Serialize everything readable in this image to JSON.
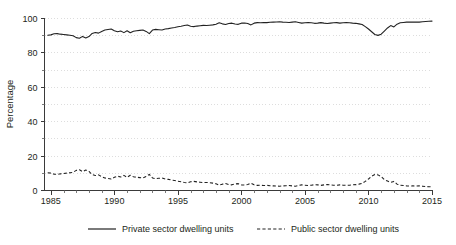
{
  "chart_data": {
    "type": "line",
    "title": "",
    "xlabel": "",
    "ylabel": "Percentage",
    "xlim": [
      1984.5,
      2015.0
    ],
    "ylim": [
      0,
      100
    ],
    "grid": true,
    "grid_interval": 10,
    "legend_position": "bottom",
    "x_ticks_major": [
      1985,
      1990,
      1995,
      2000,
      2005,
      2010,
      2015
    ],
    "x_tick_labels": [
      "1985",
      "1990",
      "1995",
      "2000",
      "2005",
      "2010",
      "2015"
    ],
    "x_minor_interval": 1,
    "y_ticks_major": [
      0,
      20,
      40,
      60,
      80,
      100
    ],
    "y_tick_labels": [
      "0",
      "20",
      "40",
      "60",
      "80",
      "100"
    ],
    "series": [
      {
        "name": "Private sector dwelling units",
        "style": "solid",
        "color": "#222222",
        "x": [
          1984.75,
          1985.0,
          1985.25,
          1985.5,
          1985.75,
          1986.0,
          1986.25,
          1986.5,
          1986.75,
          1987.0,
          1987.25,
          1987.5,
          1987.75,
          1988.0,
          1988.25,
          1988.5,
          1988.75,
          1989.0,
          1989.25,
          1989.5,
          1989.75,
          1990.0,
          1990.25,
          1990.5,
          1990.75,
          1991.0,
          1991.25,
          1991.5,
          1991.75,
          1992.0,
          1992.25,
          1992.5,
          1992.75,
          1993.0,
          1993.25,
          1993.5,
          1993.75,
          1994.0,
          1994.25,
          1994.5,
          1994.75,
          1995.0,
          1995.25,
          1995.5,
          1995.75,
          1996.0,
          1996.25,
          1996.5,
          1996.75,
          1997.0,
          1997.25,
          1997.5,
          1997.75,
          1998.0,
          1998.25,
          1998.5,
          1998.75,
          1999.0,
          1999.25,
          1999.5,
          1999.75,
          2000.0,
          2000.25,
          2000.5,
          2000.75,
          2001.0,
          2001.25,
          2001.5,
          2001.75,
          2002.0,
          2002.25,
          2002.5,
          2002.75,
          2003.0,
          2003.25,
          2003.5,
          2003.75,
          2004.0,
          2004.25,
          2004.5,
          2004.75,
          2005.0,
          2005.25,
          2005.5,
          2005.75,
          2006.0,
          2006.25,
          2006.5,
          2006.75,
          2007.0,
          2007.25,
          2007.5,
          2007.75,
          2008.0,
          2008.25,
          2008.5,
          2008.75,
          2009.0,
          2009.25,
          2009.5,
          2009.75,
          2010.0,
          2010.25,
          2010.5,
          2010.75,
          2011.0,
          2011.25,
          2011.5,
          2011.75,
          2012.0,
          2012.25,
          2012.5,
          2012.75,
          2013.0,
          2013.25,
          2013.5,
          2013.75,
          2014.0,
          2014.25,
          2014.5,
          2014.75,
          2015.0
        ],
        "values": [
          90.0,
          90.2,
          90.8,
          90.9,
          90.6,
          90.4,
          90.2,
          90.0,
          89.7,
          88.6,
          88.2,
          89.3,
          88.4,
          89.2,
          91.0,
          91.6,
          91.2,
          92.2,
          93.0,
          93.3,
          93.6,
          92.6,
          92.0,
          92.4,
          91.5,
          92.6,
          91.4,
          92.3,
          92.6,
          92.8,
          93.0,
          92.2,
          90.9,
          93.0,
          93.4,
          93.2,
          93.0,
          93.6,
          93.8,
          94.2,
          94.5,
          94.9,
          95.2,
          95.6,
          95.9,
          95.2,
          95.0,
          95.3,
          95.5,
          95.7,
          95.6,
          95.8,
          96.0,
          96.4,
          97.2,
          96.6,
          96.2,
          96.8,
          97.0,
          96.5,
          96.3,
          97.0,
          97.1,
          96.8,
          96.0,
          97.0,
          97.3,
          97.2,
          97.4,
          97.3,
          97.5,
          97.6,
          97.7,
          97.8,
          97.6,
          97.5,
          97.4,
          97.6,
          97.8,
          97.4,
          97.0,
          97.2,
          97.4,
          97.2,
          96.9,
          97.0,
          97.3,
          97.0,
          96.8,
          97.0,
          97.2,
          97.3,
          97.0,
          97.2,
          97.3,
          97.2,
          97.0,
          96.9,
          96.6,
          96.2,
          95.0,
          93.6,
          92.0,
          90.4,
          89.9,
          90.6,
          92.4,
          94.2,
          95.6,
          94.8,
          96.4,
          97.2,
          97.4,
          97.6,
          97.7,
          97.6,
          97.7,
          97.6,
          97.8,
          98.0,
          98.1,
          98.2
        ],
        "note": "Starts near 90 in 1985, gradual rise to ~97-98 by 2000s, sharp dip to ~90 around 2010-2011, recovers to ~98 by 2015"
      },
      {
        "name": "Public sector dwelling units",
        "style": "dashed",
        "color": "#222222",
        "x": [
          1984.75,
          1985.0,
          1985.25,
          1985.5,
          1985.75,
          1986.0,
          1986.25,
          1986.5,
          1986.75,
          1987.0,
          1987.25,
          1987.5,
          1987.75,
          1988.0,
          1988.25,
          1988.5,
          1988.75,
          1989.0,
          1989.25,
          1989.5,
          1989.75,
          1990.0,
          1990.25,
          1990.5,
          1990.75,
          1991.0,
          1991.25,
          1991.5,
          1991.75,
          1992.0,
          1992.25,
          1992.5,
          1992.75,
          1993.0,
          1993.25,
          1993.5,
          1993.75,
          1994.0,
          1994.25,
          1994.5,
          1994.75,
          1995.0,
          1995.25,
          1995.5,
          1995.75,
          1996.0,
          1996.25,
          1996.5,
          1996.75,
          1997.0,
          1997.25,
          1997.5,
          1997.75,
          1998.0,
          1998.25,
          1998.5,
          1998.75,
          1999.0,
          1999.25,
          1999.5,
          1999.75,
          2000.0,
          2000.25,
          2000.5,
          2000.75,
          2001.0,
          2001.25,
          2001.5,
          2001.75,
          2002.0,
          2002.25,
          2002.5,
          2002.75,
          2003.0,
          2003.25,
          2003.5,
          2003.75,
          2004.0,
          2004.25,
          2004.5,
          2004.75,
          2005.0,
          2005.25,
          2005.5,
          2005.75,
          2006.0,
          2006.25,
          2006.5,
          2006.75,
          2007.0,
          2007.25,
          2007.5,
          2007.75,
          2008.0,
          2008.25,
          2008.5,
          2008.75,
          2009.0,
          2009.25,
          2009.5,
          2009.75,
          2010.0,
          2010.25,
          2010.5,
          2010.75,
          2011.0,
          2011.25,
          2011.5,
          2011.75,
          2012.0,
          2012.25,
          2012.5,
          2012.75,
          2013.0,
          2013.25,
          2013.5,
          2013.75,
          2014.0,
          2014.25,
          2014.5,
          2014.75,
          2015.0
        ],
        "values": [
          10.0,
          9.8,
          9.2,
          9.1,
          9.4,
          9.6,
          9.8,
          10.0,
          10.3,
          11.4,
          11.8,
          10.7,
          11.6,
          10.8,
          9.0,
          8.4,
          8.8,
          7.8,
          7.0,
          6.7,
          6.4,
          7.4,
          8.0,
          7.6,
          8.5,
          7.4,
          8.6,
          7.7,
          7.4,
          7.2,
          7.0,
          7.8,
          9.1,
          7.0,
          6.6,
          6.8,
          7.0,
          6.4,
          6.2,
          5.8,
          5.5,
          5.1,
          4.8,
          4.4,
          4.1,
          4.8,
          5.0,
          4.7,
          4.5,
          4.3,
          4.4,
          4.2,
          4.0,
          3.6,
          2.8,
          3.4,
          3.8,
          3.2,
          3.0,
          3.5,
          3.7,
          3.0,
          2.9,
          3.2,
          4.0,
          3.0,
          2.7,
          2.8,
          2.6,
          2.7,
          2.5,
          2.4,
          2.3,
          2.2,
          2.4,
          2.5,
          2.6,
          2.4,
          2.2,
          2.6,
          3.0,
          2.8,
          2.6,
          2.8,
          3.1,
          3.0,
          2.7,
          3.0,
          3.2,
          3.0,
          2.8,
          2.7,
          3.0,
          2.8,
          2.7,
          2.8,
          3.0,
          3.1,
          3.4,
          3.8,
          5.0,
          6.4,
          8.0,
          9.0,
          8.8,
          7.8,
          6.0,
          5.2,
          4.4,
          5.0,
          3.4,
          2.8,
          2.6,
          2.4,
          2.3,
          2.4,
          2.3,
          2.4,
          2.2,
          2.0,
          1.9,
          1.8
        ],
        "note": "Starts near 10 in 1985, peaks ~11.8 in 1987, declines to ~2-3 by 2000s, bump to ~9 around 2011, settles near 1.8 by 2015"
      }
    ],
    "legend": [
      {
        "label": "Private sector dwelling units",
        "style": "solid"
      },
      {
        "label": "Public sector dwelling units",
        "style": "dashed"
      }
    ]
  }
}
